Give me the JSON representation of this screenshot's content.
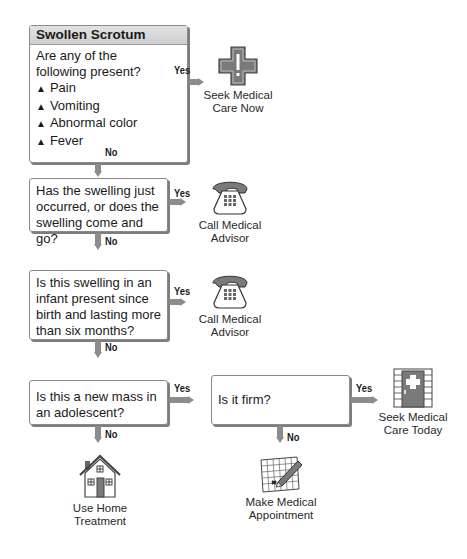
{
  "title": "Swollen Scrotum",
  "questions": [
    {
      "text": "Are any of the following present?",
      "line1": "Are any of the",
      "line2": "following present?",
      "symptoms": [
        "Pain",
        "Vomiting",
        "Abnormal color",
        "Fever"
      ],
      "yes": "Yes",
      "no": "No"
    },
    {
      "lines": [
        "Has the swelling just",
        "occurred, or does the",
        "swelling come and go?"
      ],
      "yes": "Yes",
      "no": "No"
    },
    {
      "lines": [
        "Is this swelling in an",
        "infant present since",
        "birth and lasting more",
        "than six months?"
      ],
      "yes": "Yes",
      "no": "No"
    },
    {
      "lines": [
        "Is this a new mass in",
        "an adolescent?"
      ],
      "yes": "Yes",
      "no": "No"
    },
    {
      "lines": [
        "Is it firm?"
      ],
      "yes": "Yes",
      "no": "No"
    }
  ],
  "outcomes": {
    "seek_now": {
      "line1": "Seek Medical",
      "line2": "Care Now",
      "icon": "medical-cross-icon"
    },
    "call_advisor_1": {
      "line1": "Call Medical",
      "line2": "Advisor",
      "icon": "telephone-icon"
    },
    "call_advisor_2": {
      "line1": "Call Medical",
      "line2": "Advisor",
      "icon": "telephone-icon"
    },
    "home": {
      "line1": "Use Home",
      "line2": "Treatment",
      "icon": "house-icon"
    },
    "seek_today": {
      "line1": "Seek Medical",
      "line2": "Care Today",
      "icon": "hospital-door-icon"
    },
    "appointment": {
      "line1": "Make Medical",
      "line2": "Appointment",
      "icon": "calendar-pencil-icon"
    }
  },
  "colors": {
    "arrow": "#8c8c8c",
    "icon_fill": "#7a7a7a",
    "header_bg": "#d8d8d8"
  }
}
